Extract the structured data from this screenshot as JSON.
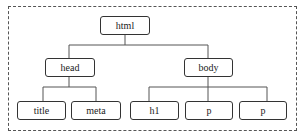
{
  "diagram": {
    "type": "tree",
    "nodes": {
      "html": "html",
      "head": "head",
      "body": "body",
      "title": "title",
      "meta": "meta",
      "h1": "h1",
      "p1": "p",
      "p2": "p"
    },
    "edges": [
      [
        "html",
        "head"
      ],
      [
        "html",
        "body"
      ],
      [
        "head",
        "title"
      ],
      [
        "head",
        "meta"
      ],
      [
        "body",
        "h1"
      ],
      [
        "body",
        "p1"
      ],
      [
        "body",
        "p2"
      ]
    ],
    "colors": {
      "stroke": "#333333",
      "background": "#ffffff",
      "text": "#222222"
    }
  }
}
